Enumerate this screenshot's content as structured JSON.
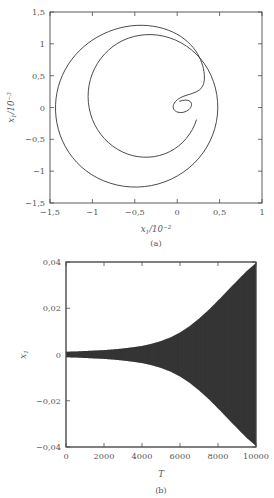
{
  "figure": {
    "panels": [
      {
        "id": "a",
        "caption": "(a)",
        "xlabel_var": "x",
        "xlabel_sub": "1",
        "xlabel_mid": "/10",
        "xlabel_sup": "−2",
        "ylabel_var": "x",
        "ylabel_sub": "1",
        "ylabel_mid": "/10",
        "ylabel_sup": "−3",
        "xticks": [
          "−1,5",
          "−1",
          "−0,5",
          "0",
          "0,5",
          "1"
        ],
        "yticks": [
          "1,5",
          "1",
          "0,5",
          "0",
          "−0,5",
          "−1",
          "−1,5"
        ]
      },
      {
        "id": "b",
        "caption": "(b)",
        "xlabel_var": "T",
        "ylabel_var": "x",
        "ylabel_sub": "1",
        "xticks": [
          "0",
          "2000",
          "4000",
          "6000",
          "8000",
          "10000"
        ],
        "yticks": [
          "0,04",
          "0,02",
          "0",
          "−0,02",
          "−0,04"
        ]
      }
    ]
  },
  "chart_data": [
    {
      "type": "line",
      "panel": "a",
      "title": "",
      "xlabel": "x1/10^-2",
      "ylabel": "x1dot/10^-3",
      "xlim": [
        -1.5,
        1.0
      ],
      "ylim": [
        -1.5,
        1.5
      ],
      "xticks": [
        -1.5,
        -1.0,
        -0.5,
        0,
        0.5,
        1.0
      ],
      "yticks": [
        1.5,
        1.0,
        0.5,
        0,
        -0.5,
        -1.0,
        -1.5
      ],
      "grid": false,
      "legend": "none",
      "description": "Phase portrait: outward spiral trajectory starting from a small inner loop near (0.35, 0.1) and growing to a large outer orbit",
      "series": [
        {
          "name": "phase-trajectory",
          "x": [
            0.35,
            0.45,
            0.55,
            0.58,
            0.52,
            0.42,
            0.33,
            0.28,
            0.3,
            0.38,
            0.5,
            0.6,
            0.62,
            0.58,
            0.48,
            0.32,
            0.1,
            -0.15,
            -0.45,
            -0.75,
            -1.05,
            -1.3,
            -1.45,
            -1.52,
            -1.48,
            -1.33,
            -1.1,
            -0.82,
            -0.5,
            -0.18,
            0.14,
            0.42,
            0.64,
            0.8,
            0.9,
            0.93,
            0.9,
            0.82,
            0.68,
            0.5,
            0.28,
            0.05,
            -0.2,
            -0.45,
            -0.68,
            -0.86,
            -0.97,
            -1.02,
            -1.0,
            -0.92,
            -0.78,
            -0.6,
            -0.4,
            -0.18,
            0.04,
            0.24,
            0.42,
            0.55,
            0.63,
            0.66
          ],
          "y": [
            0.1,
            0.12,
            0.09,
            0.02,
            -0.04,
            -0.05,
            0.0,
            0.07,
            0.14,
            0.2,
            0.26,
            0.36,
            0.52,
            0.7,
            0.92,
            1.1,
            1.24,
            1.29,
            1.26,
            1.15,
            0.96,
            0.7,
            0.4,
            0.08,
            -0.25,
            -0.56,
            -0.84,
            -1.08,
            -1.27,
            -1.4,
            -1.44,
            -1.4,
            -1.27,
            -1.06,
            -0.8,
            -0.5,
            -0.2,
            0.08,
            0.34,
            0.55,
            0.7,
            0.78,
            0.8,
            0.75,
            0.64,
            0.48,
            0.28,
            0.06,
            -0.16,
            -0.36,
            -0.54,
            -0.68,
            -0.78,
            -0.82,
            -0.8,
            -0.72,
            -0.58,
            -0.4,
            -0.2,
            0.0
          ]
        }
      ]
    },
    {
      "type": "line",
      "panel": "b",
      "title": "",
      "xlabel": "T",
      "ylabel": "x1",
      "xlim": [
        0,
        10000
      ],
      "ylim": [
        -0.04,
        0.04
      ],
      "xticks": [
        0,
        2000,
        4000,
        6000,
        8000,
        10000
      ],
      "yticks": [
        0.04,
        0.02,
        0,
        -0.02,
        -0.04
      ],
      "grid": false,
      "legend": "none",
      "description": "Time history of x1 showing an oscillation whose envelope grows exponentially from near zero at T=0 to about +/-0.04 at T=10000",
      "envelope": {
        "T": [
          0,
          500,
          1000,
          1500,
          2000,
          2500,
          3000,
          3500,
          4000,
          4500,
          5000,
          5500,
          6000,
          6500,
          7000,
          7500,
          8000,
          8500,
          9000,
          9500,
          10000
        ],
        "amplitude": [
          0.0012,
          0.0013,
          0.0015,
          0.0017,
          0.0019,
          0.0022,
          0.0026,
          0.0031,
          0.0037,
          0.0046,
          0.0058,
          0.0074,
          0.0095,
          0.0122,
          0.0155,
          0.0192,
          0.0233,
          0.0276,
          0.0318,
          0.036,
          0.0395
        ]
      }
    }
  ]
}
